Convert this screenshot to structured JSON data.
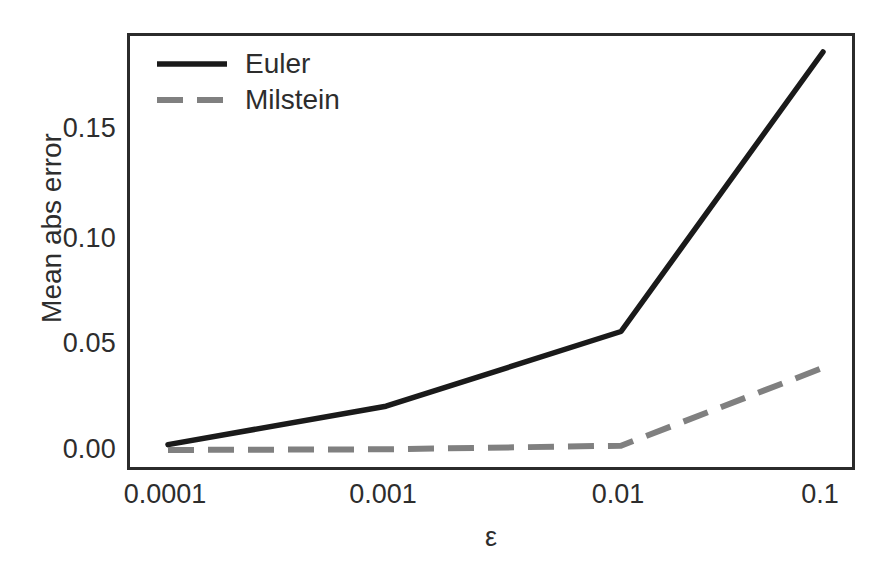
{
  "chart_data": {
    "type": "line",
    "title": "",
    "subtitle": "",
    "xlabel": "ε",
    "ylabel": "Mean abs error",
    "x_scale": "categorical-log",
    "categories": [
      "0.0001",
      "0.001",
      "0.01",
      "0.1"
    ],
    "x": [
      0.0001,
      0.001,
      0.01,
      0.1
    ],
    "xtick_labels": [
      "0.0001",
      "0.001",
      "0.01",
      "0.1"
    ],
    "ytick_labels": [
      "0.00",
      "0.05",
      "0.10",
      "0.15"
    ],
    "yticks": [
      0.0,
      0.05,
      0.1,
      0.15
    ],
    "ylim": [
      -0.0103,
      0.1945
    ],
    "grid": false,
    "legend_position": "upper-left-inside",
    "series": [
      {
        "name": "Euler",
        "values": [
          0.003,
          0.021,
          0.056,
          0.187
        ],
        "color": "#1a1a1a",
        "linestyle": "solid",
        "linewidth": 5
      },
      {
        "name": "Milstein",
        "values": [
          0.0005,
          0.0008,
          0.0025,
          0.039
        ],
        "color": "#808080",
        "linestyle": "dashed",
        "linewidth": 5
      }
    ]
  },
  "axes": {
    "frame_color": "#2b2b2b",
    "background": "#ffffff",
    "y_title": "Mean abs error",
    "x_title": "ε"
  },
  "legend": {
    "entries": [
      {
        "label": "Euler",
        "color": "#1a1a1a",
        "style": "solid"
      },
      {
        "label": "Milstein",
        "color": "#808080",
        "style": "dashed"
      }
    ]
  },
  "ticks": {
    "y": [
      {
        "label": "0.15",
        "value": 0.15,
        "top": 115
      },
      {
        "label": "0.10",
        "value": 0.1,
        "top": 225
      },
      {
        "label": "0.05",
        "value": 0.05,
        "top": 330
      },
      {
        "label": "0.00",
        "value": 0.0,
        "top": 436
      }
    ],
    "x": [
      {
        "label": "0.0001",
        "value": 0.0001,
        "left": 165
      },
      {
        "label": "0.001",
        "value": 0.001,
        "left": 383
      },
      {
        "label": "0.01",
        "value": 0.01,
        "left": 618
      },
      {
        "label": "0.1",
        "value": 0.1,
        "left": 820
      }
    ]
  }
}
